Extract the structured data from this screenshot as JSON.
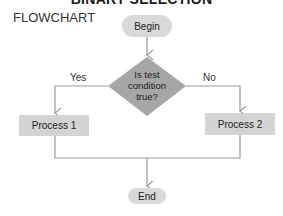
{
  "header": {
    "title": "BINARY SELECTION",
    "subtitle": "FLOWCHART"
  },
  "nodes": {
    "begin": "Begin",
    "decision": [
      "Is test",
      "condition",
      "true?"
    ],
    "process1": "Process 1",
    "process2": "Process 2",
    "end": "End"
  },
  "edges": {
    "yes_label": "Yes",
    "no_label": "No"
  },
  "colors": {
    "node_fill": "#d9d9d9",
    "decision_fill": "#a6a6a6",
    "line": "#9a9a9a"
  }
}
